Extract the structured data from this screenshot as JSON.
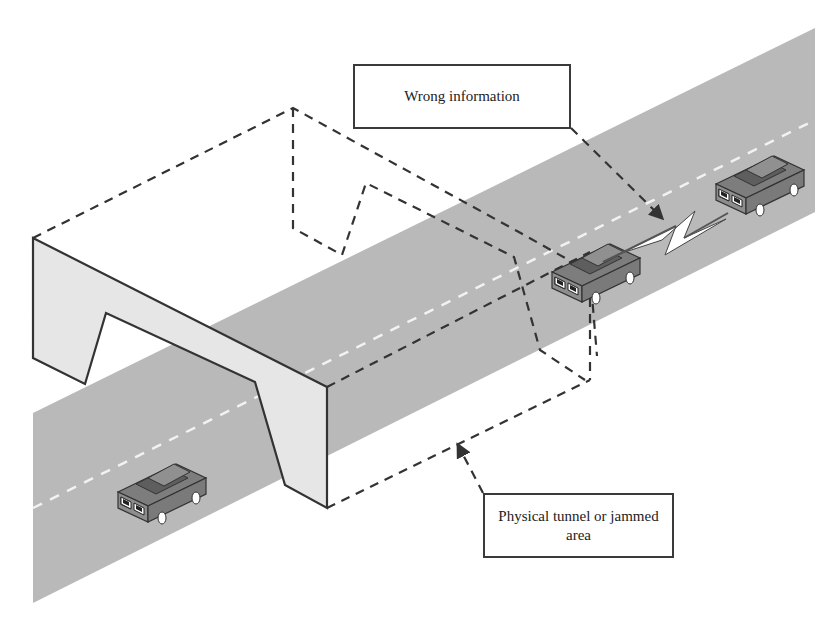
{
  "diagram": {
    "title": "",
    "labels": {
      "wrong_information": "Wrong information",
      "physical_tunnel": "Physical tunnel or jammed area"
    },
    "elements": [
      {
        "id": "road",
        "type": "road-strip",
        "description": "Gray two-lane road running diagonally with dashed white centerline"
      },
      {
        "id": "tunnel-wall",
        "type": "tunnel-portal",
        "description": "Light gray tunnel entrance wall"
      },
      {
        "id": "tunnel-outline",
        "type": "dashed-volume",
        "description": "Dashed outline of tunnel / jammed region"
      },
      {
        "id": "car-rear",
        "type": "vehicle",
        "position": "lower-left, before tunnel"
      },
      {
        "id": "car-in-tunnel",
        "type": "vehicle",
        "position": "inside tunnel area"
      },
      {
        "id": "car-front",
        "type": "vehicle",
        "position": "upper-right, beyond tunnel"
      },
      {
        "id": "lightning",
        "type": "wireless-link",
        "description": "Lightning bolt between car inside tunnel and car ahead"
      }
    ],
    "colors": {
      "road": "#b9b9b9",
      "tunnel_wall": "#e6e6e6",
      "outline": "#333333",
      "centerline": "#f2f2f2",
      "car_body": "#8a8a8a",
      "car_roof": "#6a6a6a",
      "background": "#ffffff"
    }
  }
}
